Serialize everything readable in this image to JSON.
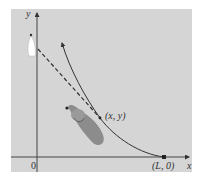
{
  "figure": {
    "panel_color": "#d4d4d4",
    "axis_color": "#4a4a4a",
    "curve_color": "#3a3a3a",
    "dog_color": "#8a8a8a",
    "boat_color": "#ffffff",
    "labels": {
      "y_axis": "y",
      "x_axis": "x",
      "origin": "0",
      "end_point": "(L, 0)",
      "point": "(x, y)"
    }
  }
}
